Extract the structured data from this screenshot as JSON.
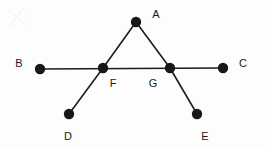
{
  "figure": {
    "type": "geometry-diagram",
    "background_color": "#fdfdfd",
    "line_color": "#1c1c1c",
    "dot_color": "#181818",
    "label_color": "#1a1a1a",
    "width": 265,
    "height": 149,
    "dot_radius": 5.2,
    "vertices": [
      {
        "id": "A",
        "label": "A",
        "cx": 136,
        "cy": 22,
        "label_x": 156,
        "label_y": 14
      },
      {
        "id": "B",
        "label": "B",
        "cx": 40,
        "cy": 69,
        "label_x": 19,
        "label_y": 63
      },
      {
        "id": "C",
        "label": "C",
        "cx": 223,
        "cy": 68,
        "label_x": 243,
        "label_y": 63
      },
      {
        "id": "D",
        "label": "D",
        "cx": 69,
        "cy": 114,
        "label_x": 68,
        "label_y": 136
      },
      {
        "id": "E",
        "label": "E",
        "cx": 197,
        "cy": 114,
        "label_x": 205,
        "label_y": 136
      },
      {
        "id": "F",
        "label": "F",
        "cx": 103,
        "cy": 68,
        "label_x": 113,
        "label_y": 83
      },
      {
        "id": "G",
        "label": "G",
        "cx": 170,
        "cy": 68,
        "label_x": 153,
        "label_y": 83
      }
    ],
    "edges": [
      {
        "id": "B-C",
        "from": "B",
        "to": "C",
        "x1": 40,
        "y1": 69,
        "x2": 223,
        "y2": 68
      },
      {
        "id": "A-F",
        "from": "A",
        "to": "F",
        "x1": 136,
        "y1": 22,
        "x2": 103,
        "y2": 68
      },
      {
        "id": "A-G",
        "from": "A",
        "to": "G",
        "x1": 136,
        "y1": 22,
        "x2": 170,
        "y2": 68
      },
      {
        "id": "F-D",
        "from": "F",
        "to": "D",
        "x1": 103,
        "y1": 68,
        "x2": 69,
        "y2": 114
      },
      {
        "id": "G-E",
        "from": "G",
        "to": "E",
        "x1": 170,
        "y1": 68,
        "x2": 197,
        "y2": 114
      }
    ]
  }
}
